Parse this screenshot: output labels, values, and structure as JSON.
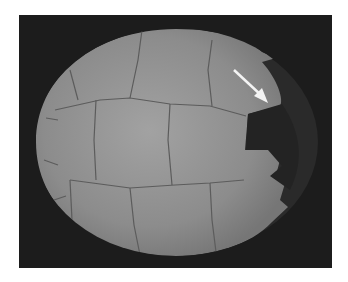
{
  "image": {
    "subject": "turtle shell (carapace) viewed from above, grayscale photograph",
    "annotation": "white arrow pointing to missing/damaged posterior-right region of shell",
    "colors": {
      "page_background": "#ffffff",
      "photo_background": "#1c1c1c",
      "shell_fill": "#8e8e8e",
      "shell_light": "#a0a0a0",
      "scute_lines": "#5a5a5a",
      "damaged_area": "#232323",
      "arrow": "#f4f4f4"
    }
  }
}
